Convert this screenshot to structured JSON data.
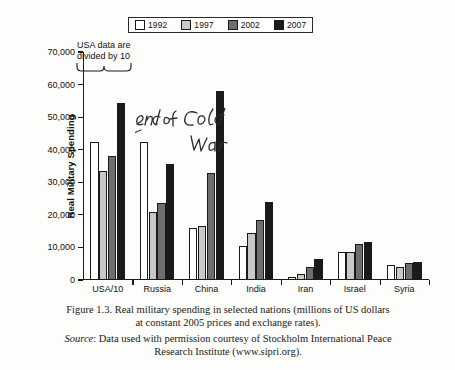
{
  "chart_data": {
    "type": "bar",
    "title": "Real military spending in selected nations",
    "xlabel": "",
    "ylabel": "Real Military Spending",
    "ylim": [
      0,
      70000
    ],
    "yticks": [
      "0",
      "10,000",
      "20,000",
      "30,000",
      "40,000",
      "50,000",
      "60,000",
      "70,000"
    ],
    "ytick_values": [
      0,
      10000,
      20000,
      30000,
      40000,
      50000,
      60000,
      70000
    ],
    "grid": false,
    "legend_position": "top-center",
    "categories": [
      "USA/10",
      "Russia",
      "China",
      "India",
      "Iran",
      "Israel",
      "Syria"
    ],
    "series": [
      {
        "name": "1992",
        "color": "#ffffff",
        "values": [
          42500,
          42500,
          16000,
          10500,
          1000,
          8500,
          4500
        ]
      },
      {
        "name": "1997",
        "color": "#c8c8c8",
        "values": [
          33500,
          21000,
          16500,
          14500,
          2000,
          8500,
          4000
        ]
      },
      {
        "name": "2002",
        "color": "#6e6e6e",
        "values": [
          38000,
          23500,
          33000,
          18500,
          4000,
          11000,
          5300
        ]
      },
      {
        "name": "2007",
        "color": "#1a1a1a",
        "values": [
          54500,
          35500,
          58000,
          24000,
          6500,
          11800,
          5500
        ]
      }
    ],
    "annotations": [
      {
        "name": "usa-divided-note",
        "text_line1": "USA data are",
        "text_line2": "divided by 10",
        "style": "printed"
      },
      {
        "name": "end-of-cold-war",
        "text_line1": "end of Cold",
        "text_line2": "War",
        "style": "handwritten"
      }
    ]
  },
  "legend": {
    "items": [
      {
        "label": "1992",
        "color": "#ffffff"
      },
      {
        "label": "1997",
        "color": "#c8c8c8"
      },
      {
        "label": "2002",
        "color": "#6e6e6e"
      },
      {
        "label": "2007",
        "color": "#1a1a1a"
      }
    ]
  },
  "caption": {
    "line1": "Figure 1.3.  Real military spending in selected nations (millions of US dollars",
    "line2": "at constant 2005 prices and exchange rates)."
  },
  "source": {
    "label": "Source",
    "line1": ": Data used with permission courtesy of Stockholm International Peace",
    "line2": "Research Institute (www.sipri.org)."
  }
}
